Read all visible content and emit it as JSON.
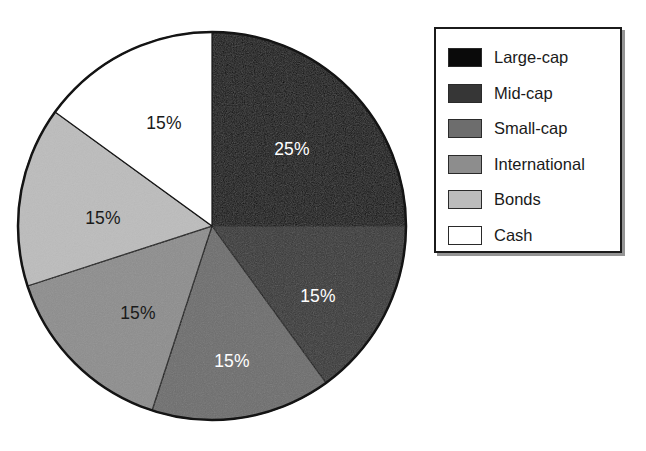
{
  "chart_data": {
    "type": "pie",
    "title": "",
    "subtitle": "",
    "xlabel": "",
    "ylabel": "",
    "grid": false,
    "legend_position": "right",
    "start_angle_deg": 0,
    "direction": "clockwise",
    "units": "percent",
    "total": 100,
    "categories": [
      "Large-cap",
      "Mid-cap",
      "Small-cap",
      "International",
      "Bonds",
      "Cash"
    ],
    "values": [
      25,
      15,
      15,
      15,
      15,
      15
    ],
    "data_labels": [
      "25%",
      "15%",
      "15%",
      "15%",
      "15%",
      "15%"
    ],
    "colors": [
      "#0a0a0a",
      "#363636",
      "#6d6d6d",
      "#8d8d8d",
      "#bcbcbc",
      "#ffffff"
    ],
    "label_colors": [
      "#ffffff",
      "#ffffff",
      "#ffffff",
      "#1a1a1a",
      "#1a1a1a",
      "#1a1a1a"
    ],
    "slices": [
      {
        "name": "Large-cap",
        "value": 25,
        "label": "25%",
        "color": "#0a0a0a",
        "label_color": "#ffffff",
        "start_deg": 0,
        "end_deg": 90
      },
      {
        "name": "Mid-cap",
        "value": 15,
        "label": "15%",
        "color": "#363636",
        "label_color": "#ffffff",
        "start_deg": 90,
        "end_deg": 144
      },
      {
        "name": "Small-cap",
        "value": 15,
        "label": "15%",
        "color": "#6d6d6d",
        "label_color": "#ffffff",
        "start_deg": 144,
        "end_deg": 198
      },
      {
        "name": "International",
        "value": 15,
        "label": "15%",
        "color": "#8d8d8d",
        "label_color": "#1a1a1a",
        "start_deg": 198,
        "end_deg": 252
      },
      {
        "name": "Bonds",
        "value": 15,
        "label": "15%",
        "color": "#bcbcbc",
        "label_color": "#1a1a1a",
        "start_deg": 252,
        "end_deg": 306
      },
      {
        "name": "Cash",
        "value": 15,
        "label": "15%",
        "color": "#ffffff",
        "label_color": "#1a1a1a",
        "start_deg": 306,
        "end_deg": 360
      }
    ]
  },
  "pie": {
    "center_x": 212,
    "center_y": 226,
    "radius": 194,
    "outline_color": "#141414",
    "outline_width": 2.5,
    "labels": [
      {
        "text": "25%",
        "x": 292,
        "y": 150,
        "color": "#ffffff"
      },
      {
        "text": "15%",
        "x": 318,
        "y": 297,
        "color": "#ffffff"
      },
      {
        "text": "15%",
        "x": 232,
        "y": 362,
        "color": "#ffffff"
      },
      {
        "text": "15%",
        "x": 138,
        "y": 314,
        "color": "#1a1a1a"
      },
      {
        "text": "15%",
        "x": 103,
        "y": 219,
        "color": "#1a1a1a"
      },
      {
        "text": "15%",
        "x": 164,
        "y": 124,
        "color": "#1a1a1a"
      }
    ]
  },
  "legend": {
    "border_color": "#1b1b1b",
    "background": "#ffffff",
    "items": [
      {
        "label": "Large-cap",
        "color": "#0a0a0a"
      },
      {
        "label": "Mid-cap",
        "color": "#363636"
      },
      {
        "label": "Small-cap",
        "color": "#6d6d6d"
      },
      {
        "label": "International",
        "color": "#8d8d8d"
      },
      {
        "label": "Bonds",
        "color": "#bcbcbc"
      },
      {
        "label": "Cash",
        "color": "#ffffff"
      }
    ]
  }
}
